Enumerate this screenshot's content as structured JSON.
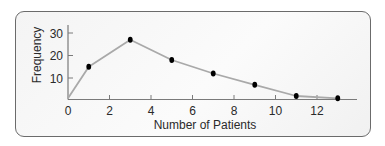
{
  "chart_data": {
    "type": "line",
    "title": "",
    "xlabel": "Number of Patients",
    "ylabel": "Frequency",
    "x": [
      0,
      1,
      3,
      5,
      7,
      9,
      11,
      13
    ],
    "series": [
      {
        "name": "Frequency polygon",
        "values": [
          1,
          15,
          27,
          18,
          12,
          7,
          2,
          1
        ],
        "markers_at_x": [
          1,
          3,
          5,
          7,
          9,
          11,
          13
        ]
      }
    ],
    "xticks": [
      0,
      2,
      4,
      6,
      8,
      10,
      12
    ],
    "yticks": [
      10,
      20,
      30
    ],
    "xlim": [
      0,
      14
    ],
    "ylim": [
      0,
      32
    ],
    "grid": false,
    "legend": null,
    "colors": {
      "line": "#a9a9a9",
      "marker": "#000000",
      "axis": "#7a7a7a",
      "frame_border": "#6b6b6b"
    }
  }
}
